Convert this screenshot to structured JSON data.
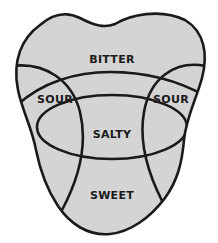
{
  "diagram": {
    "title": "",
    "regions": [
      {
        "id": "bitter",
        "label": "BITTER"
      },
      {
        "id": "sour-left",
        "label": "SOUR"
      },
      {
        "id": "sour-right",
        "label": "SOUR"
      },
      {
        "id": "salty",
        "label": "SALTY"
      },
      {
        "id": "sweet",
        "label": "SWEET"
      }
    ],
    "colors": {
      "fill": "#d4d4d4",
      "stroke": "#1a1a1a",
      "background": "#ffffff"
    }
  }
}
